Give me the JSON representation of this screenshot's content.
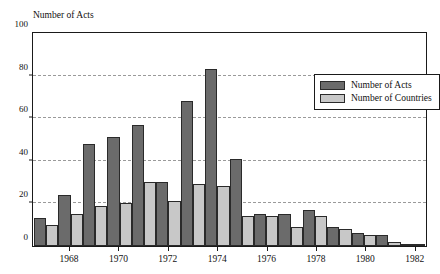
{
  "chart_data": {
    "type": "bar",
    "title": "",
    "axis_title": "Number of Acts",
    "xlabel": "",
    "ylabel": "Number of Acts",
    "ylim": [
      0,
      100
    ],
    "yticks": [
      0,
      20,
      40,
      60,
      80,
      100
    ],
    "grid": "horizontal dashed gridlines at 20, 40, 60, 80",
    "legend_position": "top-right inside plot",
    "categories": [
      "1967",
      "1968",
      "1969",
      "1970",
      "1971",
      "1972",
      "1973",
      "1974",
      "1975",
      "1976",
      "1977",
      "1978",
      "1979",
      "1980",
      "1981",
      "1982"
    ],
    "xtick_labels": [
      "1968",
      "1970",
      "1972",
      "1974",
      "1976",
      "1978",
      "1980",
      "1982"
    ],
    "series": [
      {
        "name": "Number of Acts",
        "color": "#6b6b6b",
        "values": [
          13,
          24,
          48,
          51,
          57,
          30,
          68,
          83,
          41,
          15,
          15,
          17,
          9,
          6,
          5,
          1
        ]
      },
      {
        "name": "Number of Countries",
        "color": "#c8c8c8",
        "values": [
          10,
          15,
          19,
          20,
          30,
          21,
          29,
          28,
          14,
          14,
          9,
          14,
          8,
          5,
          2,
          1
        ]
      }
    ]
  },
  "legend": {
    "items": [
      {
        "label": "Number of Acts",
        "swatch": "acts"
      },
      {
        "label": "Number of Countries",
        "swatch": "countries"
      }
    ]
  },
  "colors": {
    "acts": "#6b6b6b",
    "countries": "#c8c8c8",
    "axis": "#1a1a1a",
    "grid": "#9a9a9a",
    "background": "#ffffff"
  }
}
